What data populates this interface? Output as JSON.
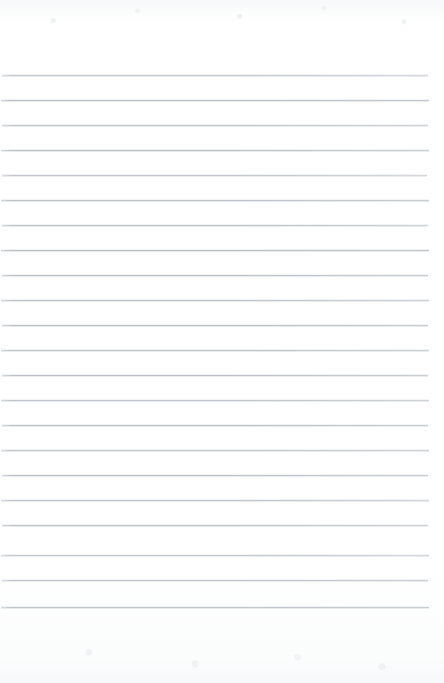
{
  "document": {
    "kind": "scanned-lined-paper",
    "title": "",
    "body_text": "",
    "has_text_content": false,
    "page_width": 444,
    "page_height": 683
  },
  "paper": {
    "background_color": "#ffffff",
    "grain_color": "#eef0f2",
    "top_margin": 75,
    "bottom_margin": 76
  },
  "ruling": {
    "line_color": "#b9bdc1",
    "line_thickness": 1,
    "line_spacing": 25,
    "line_count": 22,
    "first_line_y": 75,
    "last_line_y": 607,
    "left_inset": 2,
    "right_inset": 16,
    "lines": [
      {
        "y": 75,
        "left": 2,
        "right": 428,
        "opacity": 0.82,
        "fade_right": 0.55
      },
      {
        "y": 100,
        "left": 1,
        "right": 429,
        "opacity": 0.95,
        "fade_right": 0.8
      },
      {
        "y": 125,
        "left": 2,
        "right": 428,
        "opacity": 0.88,
        "fade_right": 0.62
      },
      {
        "y": 150,
        "left": 1,
        "right": 429,
        "opacity": 0.92,
        "fade_right": 0.7
      },
      {
        "y": 175,
        "left": 2,
        "right": 427,
        "opacity": 0.86,
        "fade_right": 0.58
      },
      {
        "y": 200,
        "left": 1,
        "right": 429,
        "opacity": 0.94,
        "fade_right": 0.76
      },
      {
        "y": 225,
        "left": 2,
        "right": 428,
        "opacity": 0.9,
        "fade_right": 0.66
      },
      {
        "y": 250,
        "left": 1,
        "right": 429,
        "opacity": 0.96,
        "fade_right": 0.84
      },
      {
        "y": 275,
        "left": 2,
        "right": 428,
        "opacity": 0.93,
        "fade_right": 0.72
      },
      {
        "y": 300,
        "left": 1,
        "right": 429,
        "opacity": 0.89,
        "fade_right": 0.64
      },
      {
        "y": 325,
        "left": 2,
        "right": 428,
        "opacity": 0.95,
        "fade_right": 0.78
      },
      {
        "y": 350,
        "left": 1,
        "right": 429,
        "opacity": 0.91,
        "fade_right": 0.68
      },
      {
        "y": 375,
        "left": 2,
        "right": 428,
        "opacity": 0.94,
        "fade_right": 0.74
      },
      {
        "y": 400,
        "left": 1,
        "right": 429,
        "opacity": 0.9,
        "fade_right": 0.66
      },
      {
        "y": 425,
        "left": 2,
        "right": 428,
        "opacity": 0.93,
        "fade_right": 0.72
      },
      {
        "y": 450,
        "left": 1,
        "right": 429,
        "opacity": 0.88,
        "fade_right": 0.62
      },
      {
        "y": 475,
        "left": 2,
        "right": 428,
        "opacity": 0.92,
        "fade_right": 0.7
      },
      {
        "y": 500,
        "left": 1,
        "right": 429,
        "opacity": 0.87,
        "fade_right": 0.6
      },
      {
        "y": 525,
        "left": 2,
        "right": 428,
        "opacity": 0.9,
        "fade_right": 0.66
      },
      {
        "y": 555,
        "left": 1,
        "right": 429,
        "opacity": 0.84,
        "fade_right": 0.56
      },
      {
        "y": 580,
        "left": 2,
        "right": 428,
        "opacity": 0.93,
        "fade_right": 0.74
      },
      {
        "y": 607,
        "left": 1,
        "right": 429,
        "opacity": 1.0,
        "fade_right": 0.86
      }
    ]
  }
}
